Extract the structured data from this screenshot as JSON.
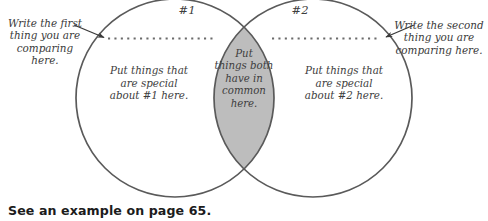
{
  "diagram": {
    "type": "venn-two-set",
    "colors": {
      "page_background": "#ffffff",
      "circle_stroke": "#5a5a5a",
      "circle_fill": "#ffffff",
      "overlap_fill": "#bdbdbd",
      "dotted_line": "#6b6b6b",
      "arrow": "#3a3a3a",
      "text": "#3d3d3d",
      "caption_text": "#1c1c1c"
    },
    "set_labels": {
      "left": "#1",
      "right": "#2"
    },
    "regions": {
      "left_only": "Put things that\nare special\nabout #1 here.",
      "right_only": "Put things that\nare special\nabout #2 here.",
      "overlap": "Put\nthings both\nhave in\ncommon\nhere."
    },
    "annotations": {
      "left": "Write the first\nthing you are\ncomparing\nhere.",
      "right": "Write the second\nthing you are\ncomparing here."
    },
    "writing_lines": {
      "style": "dotted",
      "count": 2
    }
  },
  "caption": {
    "text": "See an example on page 65."
  }
}
